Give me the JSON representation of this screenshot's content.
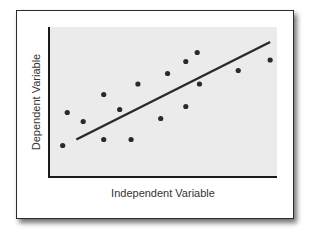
{
  "chart_data": {
    "type": "scatter",
    "title": "",
    "xlabel": "Independent Variable",
    "ylabel": "Dependent Variable",
    "xlim": [
      0,
      10
    ],
    "ylim": [
      0,
      10
    ],
    "grid": false,
    "legend": null,
    "series": [
      {
        "name": "observations",
        "points": [
          {
            "x": 0.6,
            "y": 2.1
          },
          {
            "x": 0.8,
            "y": 4.3
          },
          {
            "x": 1.5,
            "y": 3.7
          },
          {
            "x": 2.4,
            "y": 5.5
          },
          {
            "x": 2.4,
            "y": 2.5
          },
          {
            "x": 3.1,
            "y": 4.5
          },
          {
            "x": 3.6,
            "y": 2.5
          },
          {
            "x": 3.9,
            "y": 6.2
          },
          {
            "x": 4.9,
            "y": 3.9
          },
          {
            "x": 5.2,
            "y": 6.9
          },
          {
            "x": 6.0,
            "y": 7.7
          },
          {
            "x": 6.0,
            "y": 4.7
          },
          {
            "x": 6.5,
            "y": 8.3
          },
          {
            "x": 6.6,
            "y": 6.2
          },
          {
            "x": 8.3,
            "y": 7.1
          },
          {
            "x": 9.7,
            "y": 7.8
          }
        ]
      }
    ],
    "trendline": {
      "type": "linear",
      "from": {
        "x": 1.2,
        "y": 2.5
      },
      "to": {
        "x": 9.7,
        "y": 9.0
      }
    },
    "colors": {
      "point": "#2a2a2a",
      "line": "#2a2a2a",
      "plot_bg": "#ebebeb",
      "axis": "#1a1a1a"
    }
  }
}
